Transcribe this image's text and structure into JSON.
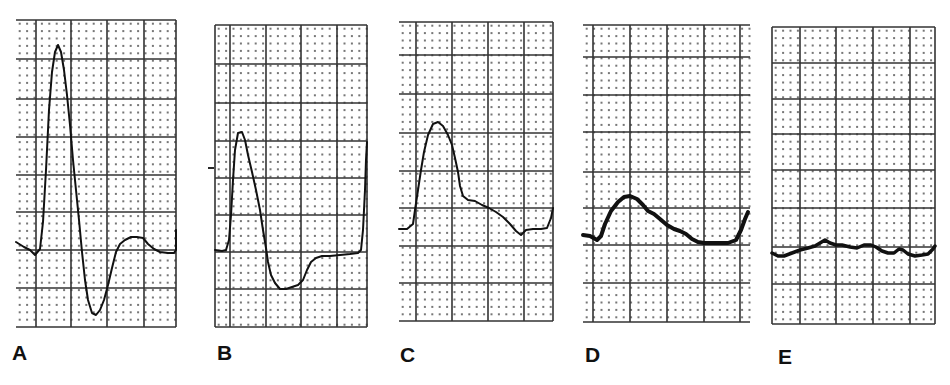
{
  "figure": {
    "colors": {
      "trace": "#111111",
      "major_grid": "#333333",
      "minor_dot": "#777777",
      "background": "#ffffff"
    }
  },
  "panels": [
    {
      "label": "A",
      "label_pos": [
        12,
        342
      ],
      "grid": {
        "x": 16,
        "y": 20,
        "w": 160,
        "h": 307,
        "major_x": [
          36,
          71,
          107,
          144,
          176
        ],
        "major_y": [
          20,
          59,
          99,
          137,
          175,
          212,
          250,
          288,
          327
        ]
      },
      "stroke_width": 2,
      "trace": [
        [
          16,
          242
        ],
        [
          24,
          247
        ],
        [
          30,
          250
        ],
        [
          35,
          255
        ],
        [
          40,
          249
        ],
        [
          43,
          222
        ],
        [
          46,
          170
        ],
        [
          49,
          110
        ],
        [
          52,
          72
        ],
        [
          55,
          52
        ],
        [
          58,
          45
        ],
        [
          61,
          52
        ],
        [
          64,
          70
        ],
        [
          67,
          95
        ],
        [
          70,
          125
        ],
        [
          73,
          160
        ],
        [
          76,
          190
        ],
        [
          79,
          220
        ],
        [
          82,
          252
        ],
        [
          85,
          280
        ],
        [
          88,
          300
        ],
        [
          92,
          313
        ],
        [
          96,
          315
        ],
        [
          100,
          310
        ],
        [
          104,
          300
        ],
        [
          108,
          285
        ],
        [
          112,
          268
        ],
        [
          116,
          252
        ],
        [
          120,
          244
        ],
        [
          125,
          240
        ],
        [
          131,
          237
        ],
        [
          137,
          237
        ],
        [
          143,
          238
        ],
        [
          148,
          244
        ],
        [
          154,
          249
        ],
        [
          160,
          252
        ],
        [
          168,
          253
        ],
        [
          174,
          253
        ],
        [
          176,
          250
        ],
        [
          176,
          230
        ]
      ]
    },
    {
      "label": "B",
      "label_pos": [
        217,
        342
      ],
      "grid": {
        "x": 215,
        "y": 25,
        "w": 152,
        "h": 302,
        "major_x": [
          215,
          230,
          266,
          301,
          337,
          367
        ],
        "major_y": [
          25,
          64,
          103,
          141,
          178,
          215,
          252,
          289,
          327
        ]
      },
      "stroke_width": 2,
      "extra_marks": [
        {
          "type": "tick",
          "x1": 208,
          "y1": 168,
          "x2": 214,
          "y2": 168
        }
      ],
      "trace": [
        [
          215,
          250
        ],
        [
          222,
          251
        ],
        [
          226,
          250
        ],
        [
          229,
          240
        ],
        [
          231,
          215
        ],
        [
          233,
          180
        ],
        [
          235,
          150
        ],
        [
          238,
          133
        ],
        [
          242,
          132
        ],
        [
          245,
          140
        ],
        [
          248,
          155
        ],
        [
          252,
          172
        ],
        [
          256,
          190
        ],
        [
          260,
          210
        ],
        [
          263,
          230
        ],
        [
          266,
          248
        ],
        [
          268,
          262
        ],
        [
          271,
          275
        ],
        [
          275,
          283
        ],
        [
          280,
          289
        ],
        [
          286,
          289
        ],
        [
          292,
          287
        ],
        [
          298,
          285
        ],
        [
          303,
          280
        ],
        [
          307,
          270
        ],
        [
          311,
          262
        ],
        [
          316,
          258
        ],
        [
          322,
          256
        ],
        [
          330,
          256
        ],
        [
          340,
          255
        ],
        [
          350,
          254
        ],
        [
          358,
          253
        ],
        [
          361,
          250
        ],
        [
          363,
          230
        ],
        [
          365,
          190
        ],
        [
          366,
          160
        ],
        [
          367,
          142
        ]
      ]
    },
    {
      "label": "C",
      "label_pos": [
        400,
        344
      ],
      "grid": {
        "x": 399,
        "y": 22,
        "w": 154,
        "h": 299,
        "major_x": [
          416,
          452,
          488,
          524,
          553
        ],
        "major_y": [
          22,
          55,
          94,
          133,
          171,
          208,
          246,
          283,
          321
        ]
      },
      "stroke_width": 2,
      "trace": [
        [
          399,
          229
        ],
        [
          407,
          229
        ],
        [
          413,
          224
        ],
        [
          415,
          210
        ],
        [
          418,
          190
        ],
        [
          421,
          170
        ],
        [
          424,
          152
        ],
        [
          428,
          135
        ],
        [
          433,
          124
        ],
        [
          438,
          122
        ],
        [
          443,
          126
        ],
        [
          448,
          135
        ],
        [
          452,
          145
        ],
        [
          455,
          158
        ],
        [
          458,
          172
        ],
        [
          460,
          186
        ],
        [
          463,
          196
        ],
        [
          468,
          200
        ],
        [
          475,
          201
        ],
        [
          482,
          205
        ],
        [
          489,
          208
        ],
        [
          496,
          212
        ],
        [
          503,
          217
        ],
        [
          510,
          224
        ],
        [
          516,
          231
        ],
        [
          521,
          235
        ],
        [
          526,
          230
        ],
        [
          533,
          229
        ],
        [
          541,
          229
        ],
        [
          547,
          228
        ],
        [
          551,
          218
        ],
        [
          553,
          208
        ]
      ]
    },
    {
      "label": "D",
      "label_pos": [
        585,
        344
      ],
      "grid": {
        "x": 583,
        "y": 25,
        "w": 167,
        "h": 297,
        "major_x": [
          593,
          630,
          667,
          704,
          740
        ],
        "major_y": [
          25,
          57,
          95,
          132,
          172,
          208,
          245,
          283,
          322
        ]
      },
      "stroke_width": 4,
      "trace": [
        [
          583,
          235
        ],
        [
          590,
          236
        ],
        [
          597,
          240
        ],
        [
          601,
          236
        ],
        [
          605,
          224
        ],
        [
          611,
          211
        ],
        [
          618,
          202
        ],
        [
          624,
          197
        ],
        [
          630,
          196
        ],
        [
          637,
          199
        ],
        [
          643,
          205
        ],
        [
          648,
          211
        ],
        [
          654,
          214
        ],
        [
          660,
          219
        ],
        [
          667,
          225
        ],
        [
          674,
          229
        ],
        [
          680,
          231
        ],
        [
          686,
          234
        ],
        [
          692,
          239
        ],
        [
          698,
          242
        ],
        [
          704,
          243
        ],
        [
          712,
          243
        ],
        [
          720,
          243
        ],
        [
          728,
          243
        ],
        [
          736,
          240
        ],
        [
          741,
          230
        ],
        [
          745,
          219
        ],
        [
          748,
          212
        ]
      ]
    },
    {
      "label": "E",
      "label_pos": [
        778,
        346
      ],
      "grid": {
        "x": 772,
        "y": 27,
        "w": 163,
        "h": 297,
        "major_x": [
          772,
          800,
          836,
          873,
          910,
          935
        ],
        "major_y": [
          27,
          63,
          99,
          134,
          170,
          208,
          247,
          284,
          324
        ]
      },
      "stroke_width": 3.5,
      "trace": [
        [
          772,
          253
        ],
        [
          778,
          256
        ],
        [
          784,
          256
        ],
        [
          792,
          253
        ],
        [
          800,
          250
        ],
        [
          808,
          248
        ],
        [
          815,
          246
        ],
        [
          820,
          243
        ],
        [
          825,
          240
        ],
        [
          830,
          243
        ],
        [
          836,
          245
        ],
        [
          842,
          245
        ],
        [
          850,
          247
        ],
        [
          857,
          248
        ],
        [
          864,
          245
        ],
        [
          871,
          245
        ],
        [
          876,
          247
        ],
        [
          882,
          251
        ],
        [
          888,
          253
        ],
        [
          894,
          253
        ],
        [
          899,
          249
        ],
        [
          903,
          250
        ],
        [
          908,
          254
        ],
        [
          915,
          256
        ],
        [
          922,
          255
        ],
        [
          928,
          254
        ],
        [
          933,
          249
        ],
        [
          935,
          246
        ]
      ]
    }
  ]
}
